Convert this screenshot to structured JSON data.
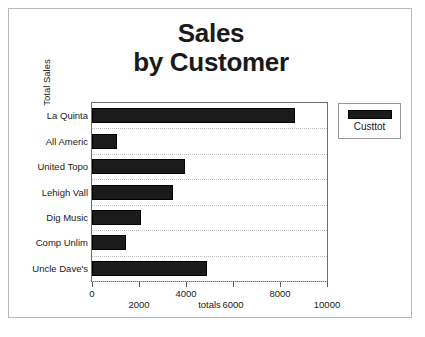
{
  "slide": {
    "title_line1": "Sales",
    "title_line2": "by Customer"
  },
  "legend": {
    "label": "Custtot",
    "swatch_color": "#1b1b1b",
    "position": "right"
  },
  "axes": {
    "y_title": "Total Sales",
    "x_title": "totals",
    "x_ticks": [
      "0",
      "2000",
      "4000",
      "6000",
      "8000",
      "10000"
    ]
  },
  "chart_data": {
    "type": "bar",
    "orientation": "horizontal",
    "title": "Sales by Customer",
    "xlabel": "totals",
    "ylabel": "Total Sales",
    "xlim": [
      0,
      10000
    ],
    "xticks": [
      0,
      2000,
      4000,
      6000,
      8000,
      10000
    ],
    "grid": true,
    "legend_position": "right",
    "categories": [
      "La Quinta",
      "All Americ",
      "United Topo",
      "Lehigh Vall",
      "Dig Music",
      "Comp Unlim",
      "Uncle Dave's"
    ],
    "series": [
      {
        "name": "Custtot",
        "color": "#1b1b1b",
        "values": [
          8650,
          1050,
          3950,
          3450,
          2100,
          1450,
          4900
        ]
      }
    ]
  }
}
